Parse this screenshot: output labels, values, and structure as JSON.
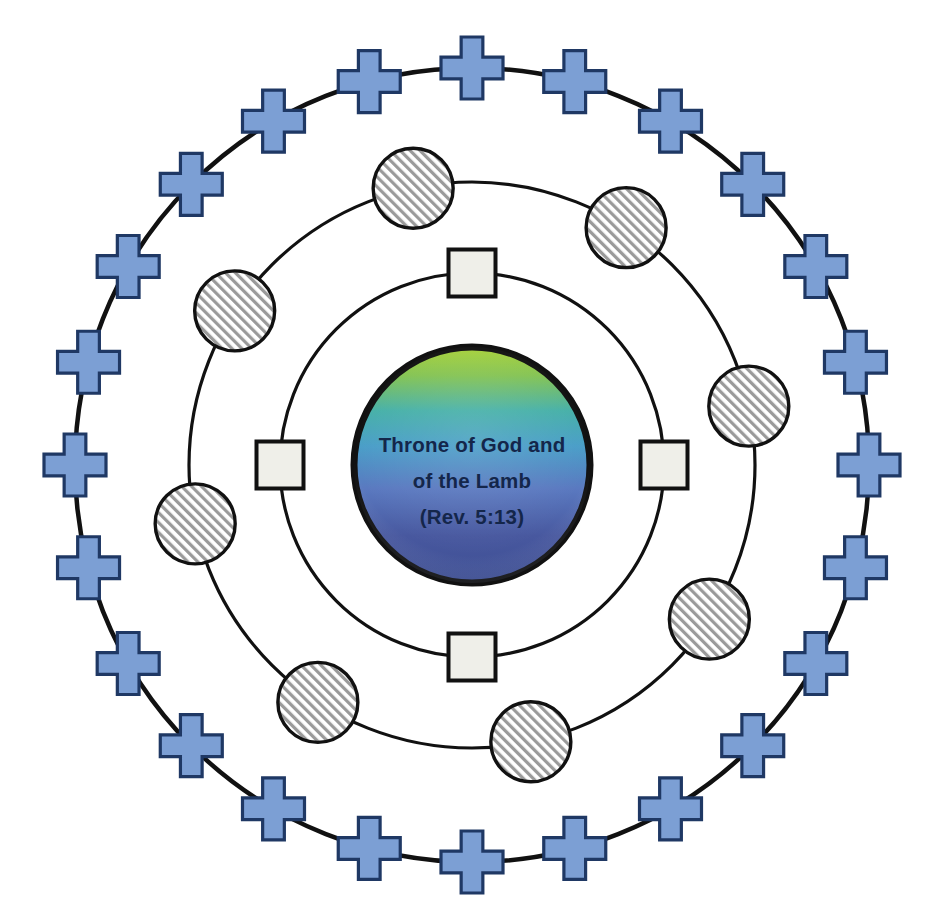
{
  "diagram": {
    "title_lines": [
      "Throne of God and",
      "of the Lamb",
      "(Rev. 5:13)"
    ],
    "center": {
      "x": 472,
      "y": 465
    },
    "colors": {
      "cross_fill": "#7C9FD4",
      "cross_stroke": "#1F3864",
      "circle_hatch_fill": "#FFFFFF",
      "circle_hatch_line": "#8C8C8C",
      "circle_stroke": "#111111",
      "square_fill": "#EFEFE9",
      "square_stroke": "#111111",
      "ring_stroke": "#111111",
      "center_stroke": "#111111",
      "center_gradient_top": "#9ACD3C",
      "center_gradient_mid": "#3FA9C4",
      "center_gradient_bottom": "#3B4E9B",
      "text_color": "#14264a",
      "background": "#FFFFFF"
    },
    "rings": [
      {
        "name": "outer-cross-ring",
        "node_shape": "cross",
        "node_count": 24,
        "radius": 397,
        "node_size": 62,
        "start_angle": -90,
        "label": "Outer ring of crosses"
      },
      {
        "name": "middle-hatched-circle-ring",
        "node_shape": "hatched-circle",
        "node_count": 8,
        "radius": 283,
        "node_size": 80,
        "start_angle": -57,
        "label": "Middle ring of hatched circles"
      },
      {
        "name": "inner-square-ring",
        "node_shape": "square",
        "node_count": 4,
        "radius": 192,
        "node_size": 47,
        "start_angle": -90,
        "label": "Inner ring of squares"
      }
    ],
    "center_node": {
      "name": "throne-center",
      "shape": "circle",
      "radius": 120,
      "stroke_width": 7
    }
  }
}
